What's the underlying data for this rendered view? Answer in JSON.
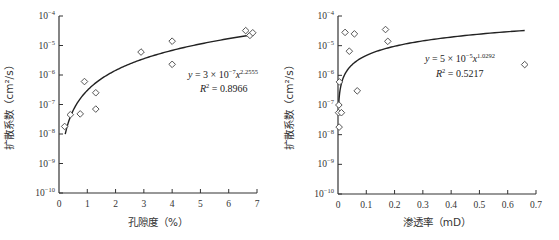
{
  "chart_data": [
    {
      "type": "scatter",
      "title": "",
      "xlabel": "孔隙度（%）",
      "ylabel": "扩散系数（cm²/s）",
      "xlim": [
        0,
        7
      ],
      "ylim": [
        1e-10,
        0.0001
      ],
      "yscale": "log",
      "grid": false,
      "x_ticks": [
        "0",
        "1",
        "2",
        "3",
        "4",
        "5",
        "6",
        "7"
      ],
      "y_ticks": [
        "10^-10",
        "10^-9",
        "10^-8",
        "10^-7",
        "10^-6",
        "10^-5",
        "10^-4"
      ],
      "points": [
        {
          "x": 0.2,
          "y": 1.8e-08
        },
        {
          "x": 0.4,
          "y": 4.5e-08
        },
        {
          "x": 0.75,
          "y": 4.8e-08
        },
        {
          "x": 0.9,
          "y": 6e-07
        },
        {
          "x": 1.3,
          "y": 2.5e-07
        },
        {
          "x": 1.3,
          "y": 7e-08
        },
        {
          "x": 2.9,
          "y": 6e-06
        },
        {
          "x": 4.0,
          "y": 1.4e-05
        },
        {
          "x": 4.0,
          "y": 2.3e-06
        },
        {
          "x": 6.6,
          "y": 3.2e-05
        },
        {
          "x": 6.75,
          "y": 2.2e-05
        },
        {
          "x": 6.85,
          "y": 2.7e-05
        }
      ],
      "fit": {
        "type": "power",
        "a": 3e-07,
        "b": 2.2555,
        "x_range": [
          0.22,
          6.8
        ]
      },
      "annotation": {
        "equation_prefix": "y = 3 × 10",
        "equation_exp": "−7",
        "equation_var": "x",
        "equation_pow": "2.2555",
        "r2_label": "R",
        "r2_value": " = 0.8966"
      }
    },
    {
      "type": "scatter",
      "title": "",
      "xlabel": "渗透率（mD）",
      "ylabel": "扩散系数（cm²/s）",
      "xlim": [
        0,
        0.7
      ],
      "ylim": [
        1e-10,
        0.0001
      ],
      "yscale": "log",
      "grid": false,
      "x_ticks": [
        "0",
        "0.1",
        "0.2",
        "0.3",
        "0.4",
        "0.5",
        "0.6",
        "0.7"
      ],
      "y_ticks": [
        "10^-10",
        "10^-9",
        "10^-8",
        "10^-7",
        "10^-6",
        "10^-5",
        "10^-4"
      ],
      "points": [
        {
          "x": 0.005,
          "y": 6e-07
        },
        {
          "x": 0.003,
          "y": 1e-07
        },
        {
          "x": 0.002,
          "y": 5.5e-08
        },
        {
          "x": 0.012,
          "y": 5.5e-08
        },
        {
          "x": 0.004,
          "y": 1.8e-08
        },
        {
          "x": 0.025,
          "y": 2.8e-05
        },
        {
          "x": 0.04,
          "y": 6.5e-06
        },
        {
          "x": 0.058,
          "y": 2.5e-05
        },
        {
          "x": 0.068,
          "y": 3e-07
        },
        {
          "x": 0.168,
          "y": 3.5e-05
        },
        {
          "x": 0.176,
          "y": 1.4e-05
        },
        {
          "x": 0.66,
          "y": 2.3e-06
        }
      ],
      "fit": {
        "type": "power",
        "a": 5e-05,
        "b": 1.0292,
        "x_range": [
          0.002,
          0.66
        ]
      },
      "annotation": {
        "equation_prefix": "y = 5 × 10",
        "equation_exp": "−5",
        "equation_var": "x",
        "equation_pow": "1.0292",
        "r2_label": "R",
        "r2_value": " = 0.5217"
      }
    }
  ],
  "labels": {
    "left_xlabel": "孔隙度（%）",
    "right_xlabel": "渗透率（mD）",
    "ylabel": "扩散系数（cm²/s）"
  }
}
